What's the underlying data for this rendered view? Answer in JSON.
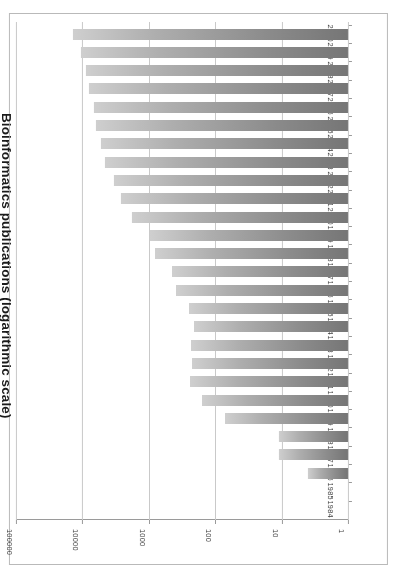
{
  "chart_data": {
    "type": "bar",
    "orientation": "horizontal",
    "title": "Bioinformatics publications (logarithmic scale)",
    "xlabel": "",
    "ylabel": "",
    "xscale": "log",
    "xlim": [
      1,
      100000
    ],
    "xticks": [
      "1",
      "10",
      "100",
      "1000",
      "10000",
      "100000"
    ],
    "grid": true,
    "legend": false,
    "categories": [
      "1984",
      "1985",
      "1986",
      "1987",
      "1988",
      "1989",
      "1990",
      "1991",
      "1992",
      "1993",
      "1994",
      "1995",
      "1996",
      "1997",
      "1998",
      "1999",
      "2000",
      "2001",
      "2002",
      "2003",
      "2004",
      "2005",
      "2006",
      "2007",
      "2008",
      "2009",
      "2010"
    ],
    "values": [
      0,
      0,
      4,
      11,
      11,
      70,
      160,
      240,
      225,
      235,
      205,
      245,
      390,
      440,
      800,
      950,
      1800,
      2600,
      3400,
      4600,
      5200,
      6200,
      6600,
      8000,
      8800,
      10500,
      14000
    ]
  },
  "figure": {
    "bar_color_dark": "#767676",
    "bar_color_light": "#cfcfcf",
    "grid_color": "#c9c9c9",
    "axis_color": "#9a9a9a",
    "frame_color": "#b9b9b9",
    "background": "#ffffff"
  }
}
